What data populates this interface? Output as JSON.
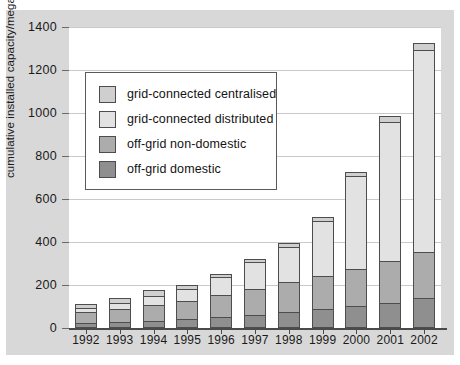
{
  "chart_data": {
    "type": "bar",
    "subtype": "stacked-vertical",
    "title": "",
    "xlabel": "",
    "ylabel": "cumulative installed capacity/megawatts",
    "ylim": [
      0,
      1400
    ],
    "ytick_step": 200,
    "yticks": [
      0,
      200,
      400,
      600,
      800,
      1000,
      1200,
      1400
    ],
    "grid": true,
    "legend_position": "upper-left-inside",
    "categories": [
      "1992",
      "1993",
      "1994",
      "1995",
      "1996",
      "1997",
      "1998",
      "1999",
      "2000",
      "2001",
      "2002"
    ],
    "series": [
      {
        "name": "off-grid domestic",
        "color": "#8f8f8f",
        "values": [
          18,
          24,
          30,
          38,
          46,
          56,
          68,
          82,
          96,
          112,
          135
        ]
      },
      {
        "name": "off-grid non-domestic",
        "color": "#acacac",
        "values": [
          50,
          60,
          72,
          85,
          105,
          120,
          140,
          155,
          175,
          195,
          215
        ]
      },
      {
        "name": "grid-connected distributed",
        "color": "#e2e2e2",
        "values": [
          22,
          30,
          42,
          55,
          80,
          125,
          165,
          255,
          430,
          645,
          940
        ]
      },
      {
        "name": "grid-connected centralised",
        "color": "#cfcfcf",
        "values": [
          15,
          21,
          26,
          17,
          14,
          14,
          17,
          18,
          19,
          28,
          30
        ]
      }
    ],
    "totals": [
      105,
      135,
      170,
      195,
      245,
      315,
      390,
      510,
      720,
      980,
      1320
    ]
  },
  "legend": {
    "items": [
      {
        "label": "grid-connected centralised",
        "color": "#cfcfcf"
      },
      {
        "label": "grid-connected distributed",
        "color": "#e2e2e2"
      },
      {
        "label": "off-grid non-domestic",
        "color": "#acacac"
      },
      {
        "label": "off-grid domestic",
        "color": "#8f8f8f"
      }
    ]
  },
  "axis": {
    "y_title": "cumulative installed capacity/megawatts",
    "y_ticks": [
      "1400",
      "1200",
      "1000",
      "800",
      "600",
      "400",
      "200",
      "0"
    ],
    "x_ticks": [
      "1992",
      "1993",
      "1994",
      "1995",
      "1996",
      "1997",
      "1998",
      "1999",
      "2000",
      "2001",
      "2002"
    ]
  },
  "colors": {
    "figure_background": "#d8d8d8",
    "plot_background": "#ffffff",
    "gridline": "#c9c9c9",
    "axis": "#4a4a4a",
    "bar_outline": "#4d4d4d",
    "text": "#1a1a1a"
  }
}
